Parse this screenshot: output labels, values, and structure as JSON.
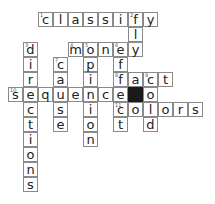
{
  "puzzle": {
    "origin": {
      "x": 8,
      "y": 12
    },
    "cell_size": 15,
    "colors": {
      "border": "#8a8a8a",
      "block": "#1a1a1a",
      "text": "#222222"
    },
    "words": [
      {
        "number": 1,
        "answer": "classify",
        "direction": "across",
        "row": 0,
        "col": 2
      },
      {
        "number": 2,
        "answer": "fly",
        "direction": "down",
        "row": 0,
        "col": 8
      },
      {
        "number": 3,
        "answer": "directions",
        "direction": "down",
        "row": 2,
        "col": 1
      },
      {
        "number": 4,
        "answer": "money",
        "direction": "across",
        "row": 2,
        "col": 4
      },
      {
        "number": 5,
        "answer": "opinion",
        "direction": "down",
        "row": 2,
        "col": 5
      },
      {
        "number": 6,
        "answer": "effect",
        "direction": "down",
        "row": 2,
        "col": 7
      },
      {
        "number": 7,
        "answer": "cause",
        "direction": "down",
        "row": 3,
        "col": 3
      },
      {
        "number": 8,
        "answer": "fact",
        "direction": "across",
        "row": 4,
        "col": 7
      },
      {
        "number": 9,
        "answer": "cold",
        "direction": "down",
        "row": 4,
        "col": 9
      },
      {
        "number": 10,
        "answer": "sequence",
        "direction": "across",
        "row": 5,
        "col": 0
      },
      {
        "number": 11,
        "answer": "colors",
        "direction": "across",
        "row": 6,
        "col": 7
      }
    ],
    "blocks": [
      {
        "row": 5,
        "col": 8
      }
    ]
  }
}
